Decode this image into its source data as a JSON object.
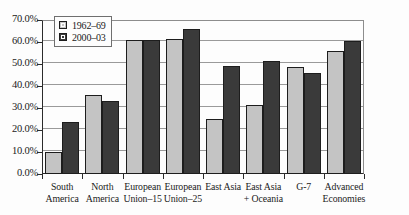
{
  "chart_data": {
    "type": "bar",
    "title": "",
    "xlabel": "",
    "ylabel": "",
    "ylim": [
      0,
      70
    ],
    "ytick_labels": [
      "70.0%",
      "60.0%",
      "50.0%",
      "40.0%",
      "30.0%",
      "20.0%",
      "10.0%",
      "0.0%"
    ],
    "ytick_values": [
      70,
      60,
      50,
      40,
      30,
      20,
      10,
      0
    ],
    "grid": true,
    "legend_position": "top-left",
    "categories": [
      "South America",
      "North America",
      "European Union–15",
      "European Union–25",
      "East Asia",
      "East Asia + Oceania",
      "G-7",
      "Advanced Economies"
    ],
    "category_lines": [
      [
        "South",
        "America"
      ],
      [
        "North",
        "America"
      ],
      [
        "European",
        "Union–15"
      ],
      [
        "European",
        "Union–25"
      ],
      [
        "East Asia",
        ""
      ],
      [
        "East Asia",
        "+ Oceania"
      ],
      [
        "G-7",
        ""
      ],
      [
        "Advanced",
        "Economies"
      ]
    ],
    "series": [
      {
        "name": "1962–69",
        "color": "#c4c4c4",
        "values": [
          10.0,
          36.0,
          61.0,
          61.5,
          25.0,
          31.5,
          48.5,
          56.0
        ]
      },
      {
        "name": "2000–03",
        "color": "#3a3a3a",
        "values": [
          23.5,
          33.0,
          61.0,
          66.0,
          49.0,
          51.5,
          46.0,
          60.5
        ]
      }
    ]
  },
  "caption": {
    "text": ""
  }
}
